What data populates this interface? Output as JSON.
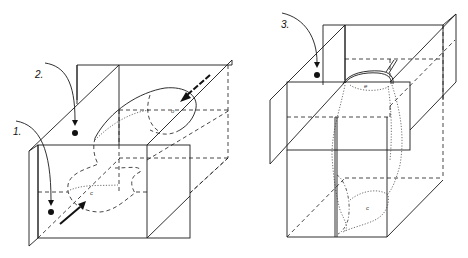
{
  "figure": {
    "background": "#ffffff",
    "stroke_color": "#1a1a1a",
    "panels": [
      {
        "id": "left",
        "description": "Two intersecting planes with a rectangular box; a dashed blob region with arrows indicating direction",
        "steps": [
          {
            "label": "1.",
            "marker": "filled-dot"
          },
          {
            "label": "2.",
            "marker": "filled-dot"
          }
        ],
        "region_labels": [
          "o",
          "c"
        ]
      },
      {
        "id": "right",
        "description": "Stacked boxes with a vertical elongated dotted region spanning the planes",
        "steps": [
          {
            "label": "3.",
            "marker": "filled-dot"
          }
        ],
        "region_labels": [
          "e",
          "c"
        ]
      }
    ]
  }
}
